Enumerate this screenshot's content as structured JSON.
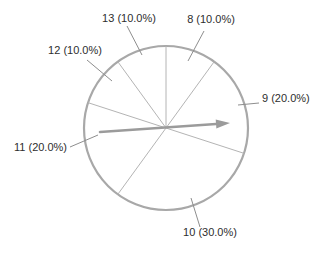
{
  "chart_data": {
    "type": "pie",
    "title": "",
    "unit": "percent",
    "start_angle_deg": 90,
    "direction": "clockwise",
    "slices": [
      {
        "label": "8",
        "value": 10.0,
        "display": "8 (10.0%)"
      },
      {
        "label": "9",
        "value": 20.0,
        "display": "9 (20.0%)"
      },
      {
        "label": "10",
        "value": 30.0,
        "display": "10 (30.0%)"
      },
      {
        "label": "11",
        "value": 20.0,
        "display": "11 (20.0%)"
      },
      {
        "label": "12",
        "value": 10.0,
        "display": "12 (10.0%)"
      },
      {
        "label": "13",
        "value": 10.0,
        "display": "13 (10.0%)"
      }
    ],
    "arrow": {
      "from": "center",
      "points_to_slice": "9",
      "direction": "right"
    },
    "legend": "none",
    "colors": {
      "outline": "#a8a8a8",
      "slice_lines": "#b4b4b4",
      "leader_lines": "#8e8e8e",
      "arrow": "#9b9b9b",
      "text": "#2e2e2e",
      "background": "#ffffff"
    }
  }
}
